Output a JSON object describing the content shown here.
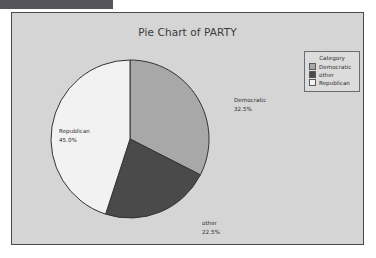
{
  "window": {
    "titlebar_color": "#56565a"
  },
  "panel": {
    "background": "#d5d5d5",
    "border_color": "#4a4a4a"
  },
  "legend": {
    "title": "Category",
    "entries": [
      {
        "label": "Democratic",
        "color": "#a8a8a8"
      },
      {
        "label": "other",
        "color": "#4a4a4a"
      },
      {
        "label": "Republican",
        "color": "#f2f2f2"
      }
    ]
  },
  "chart_data": {
    "type": "pie",
    "title": "Pie Chart of PARTY",
    "xlabel": "",
    "ylabel": "",
    "legend_position": "top-right",
    "grid": false,
    "start_angle_deg": 0,
    "direction": "clockwise",
    "categories": [
      "Democratic",
      "other",
      "Republican"
    ],
    "values": [
      32.5,
      22.5,
      45.0
    ],
    "labels": [
      "32.5%",
      "22.5%",
      "45.0%"
    ],
    "colors": [
      "#a8a8a8",
      "#4a4a4a",
      "#f2f2f2"
    ],
    "slice_edge_color": "#333333",
    "total": 100.0,
    "annotations": [
      {
        "category": "Democratic",
        "text": "Democratic",
        "value_text": "32.5%"
      },
      {
        "category": "other",
        "text": "other",
        "value_text": "22.5%"
      },
      {
        "category": "Republican",
        "text": "Republican",
        "value_text": "45.0%"
      }
    ]
  }
}
